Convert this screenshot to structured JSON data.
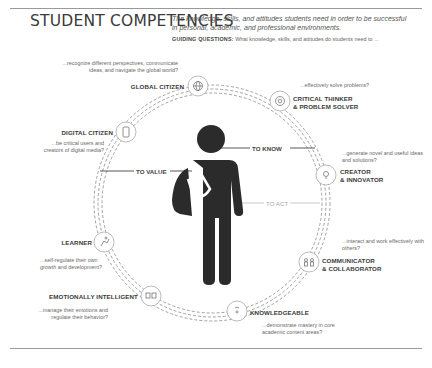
{
  "header": {
    "title": "STUDENT COMPETENCIES",
    "subtitle": "The knowledge, skills, and attitudes students need in order to be successful in personal, academic, and professional environments.",
    "guiding_label": "GUIDING QUESTIONS:",
    "guiding_text": "What knowledge, skills, and attitudes do students need to ..."
  },
  "center": {
    "figure": "student-with-backpack",
    "to_know": "TO KNOW",
    "to_value": "TO VALUE",
    "to_act": "TO ACT"
  },
  "competencies": [
    {
      "label": "GLOBAL CITIZEN",
      "question": "...recognize different perspectives, communicate ideas, and navigate the global world?",
      "icon": "globe-icon"
    },
    {
      "label": "CRITICAL THINKER",
      "label2": "& PROBLEM SOLVER",
      "question": "...effectively solve problems?",
      "icon": "at-sign-icon"
    },
    {
      "label": "CREATOR",
      "label2": "& INNOVATOR",
      "question": "...generate novel and useful ideas and solutions?",
      "icon": "lightbulb-head-icon"
    },
    {
      "label": "COMMUNICATOR",
      "label2": "& COLLABORATOR",
      "question": "...interact and work effectively with others?",
      "icon": "people-icon"
    },
    {
      "label": "KNOWLEDGEABLE",
      "question": "...demonstrate mastery in core academic content areas?",
      "icon": "head-gear-icon"
    },
    {
      "label": "EMOTIONALLY INTELLIGENT",
      "question": "...manage their emotions and regulate their behavior?",
      "icon": "masks-icon"
    },
    {
      "label": "LEARNER",
      "question": "...self-regulate their own growth and development?",
      "icon": "climber-icon"
    },
    {
      "label": "DIGITAL CITIZEN",
      "question": "...be critical users and creators of digital media?",
      "icon": "device-icon"
    }
  ],
  "colors": {
    "figure": "#2b2b2b",
    "rule": "#9a9a9a",
    "dash": "#8a8a8a"
  }
}
